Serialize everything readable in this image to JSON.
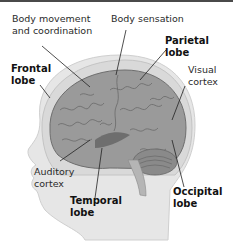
{
  "diagram": {
    "labels": {
      "body_movement": "Body movement\nand coordination",
      "body_sensation": "Body sensation",
      "parietal": "Parietal\nlobe",
      "frontal": "Frontal\nlobe",
      "visual": "Visual\ncortex",
      "auditory": "Auditory\ncortex",
      "temporal": "Temporal\nlobe",
      "occipital": "Occipital\nlobe"
    },
    "colors": {
      "head": "#e6e6e6",
      "head_outline": "#c8c8c8",
      "skull": "#d9d9d9",
      "brain": "#9a9a9a",
      "brain_dark": "#6e6e6e",
      "leader_line": "#222222"
    }
  }
}
